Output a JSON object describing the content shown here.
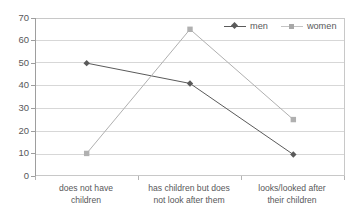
{
  "chart_data": {
    "type": "line",
    "title": "",
    "subtitle": "",
    "xlabel": "",
    "ylabel": "",
    "ylim": [
      0,
      70
    ],
    "yticks": [
      0,
      10,
      20,
      30,
      40,
      50,
      60,
      70
    ],
    "grid": true,
    "legend_position": "top-right",
    "categories": [
      "does not have children",
      "has children but does not look after them",
      "looks/looked after their children"
    ],
    "category_lines": [
      [
        "does not have",
        "children"
      ],
      [
        "has children but does",
        "not look after them"
      ],
      [
        "looks/looked after",
        "their children"
      ]
    ],
    "series": [
      {
        "name": "men",
        "values": [
          50,
          41,
          9.5
        ],
        "color": "#5a5a5a",
        "marker": "diamond"
      },
      {
        "name": "women",
        "values": [
          10,
          65,
          25
        ],
        "color": "#b0b0b0",
        "marker": "square"
      }
    ]
  },
  "legend": {
    "entries": [
      {
        "label": "men",
        "marker": "diamond-marker-icon"
      },
      {
        "label": "women",
        "marker": "square-marker-icon"
      }
    ]
  },
  "axis": {
    "y_tick_labels": [
      "70",
      "60",
      "50",
      "40",
      "30",
      "20",
      "10",
      "0"
    ]
  },
  "colors": {
    "men_series": "#5a5a5a",
    "women_series": "#b0b0b0",
    "gridline": "#d7d7d7",
    "frame": "#c8c8c8",
    "text": "#58585a",
    "background": "#ffffff"
  }
}
